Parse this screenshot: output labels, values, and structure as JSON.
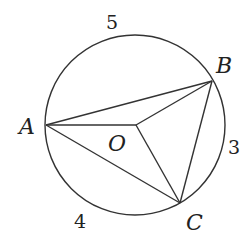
{
  "diagram": {
    "type": "geometry-circle-inscribed-triangle",
    "circle": {
      "center_label": "O",
      "cx": 135,
      "cy": 125,
      "r": 90
    },
    "points": {
      "A": {
        "label": "A",
        "x": 46,
        "y": 125
      },
      "B": {
        "label": "B",
        "x": 212,
        "y": 81
      },
      "C": {
        "label": "C",
        "x": 180,
        "y": 203
      },
      "O": {
        "label": "O",
        "x": 136,
        "y": 125
      }
    },
    "arc_labels": {
      "AB": "5",
      "BC": "3",
      "CA": "4"
    },
    "segments": [
      "AB",
      "BC",
      "CA",
      "OA",
      "OB",
      "OC"
    ],
    "stroke_color": "#333333"
  }
}
